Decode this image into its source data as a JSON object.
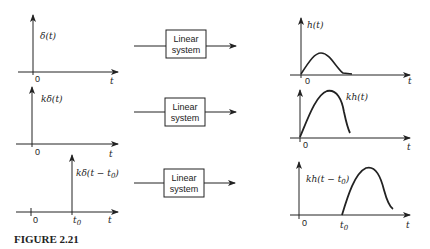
{
  "rows": [
    {
      "input_label": "δ(t)",
      "system_label_line1": "Linear",
      "system_label_line2": "system",
      "output_label": "h(t)",
      "origin_label": "0",
      "axis_label": "t"
    },
    {
      "input_label": "kδ(t)",
      "system_label_line1": "Linear",
      "system_label_line2": "system",
      "output_label": "kh(t)",
      "origin_label": "0",
      "axis_label": "t"
    },
    {
      "input_label": "kδ(t − t0)",
      "input_label_main": "kδ(t − t",
      "input_label_sub": "0",
      "input_label_close": ")",
      "system_label_line1": "Linear",
      "system_label_line2": "system",
      "output_label_main": "kh(t − t",
      "output_label_sub": "0",
      "output_label_close": ")",
      "origin_label": "0",
      "shift_label": "t",
      "shift_sub": "0",
      "axis_label": "t"
    }
  ],
  "caption": "FIGURE  2.21",
  "colors": {
    "ink": "#222222",
    "background": "#ffffff"
  }
}
